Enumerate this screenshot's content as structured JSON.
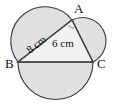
{
  "figure": {
    "background_color": "#ffffff",
    "fill_color": "#e0e0e0",
    "stroke_color": "#3a3a3a",
    "text_color": "#111111",
    "vertices": [
      {
        "name": "A",
        "label": "A",
        "x": 72,
        "y": 20,
        "label_x": 74,
        "label_y": 13
      },
      {
        "name": "B",
        "label": "B",
        "x": 18,
        "y": 62,
        "label_x": 5,
        "label_y": 68
      },
      {
        "name": "C",
        "label": "C",
        "x": 93,
        "y": 62,
        "label_x": 97,
        "label_y": 68
      }
    ],
    "sides": [
      {
        "name": "AB",
        "label": "8 cm",
        "label_x": 30,
        "label_y": 54,
        "rotation": -38
      },
      {
        "name": "AC",
        "label": "6 cm",
        "label_x": 52,
        "label_y": 47,
        "rotation": 0
      },
      {
        "name": "BC",
        "label": "",
        "label_x": 0,
        "label_y": 0,
        "rotation": 0
      }
    ],
    "angle_marker": {
      "name": "right-angle-at-A",
      "vertex": "A",
      "symbol": "square",
      "degrees": 90
    },
    "semicircles": [
      {
        "name": "semicircle-on-AB",
        "side": "AB",
        "orientation": "outward-upper-left"
      },
      {
        "name": "semicircle-on-AC",
        "side": "AC",
        "orientation": "outward-upper-right"
      },
      {
        "name": "semicircle-on-BC",
        "side": "BC",
        "orientation": "outward-below"
      }
    ]
  }
}
